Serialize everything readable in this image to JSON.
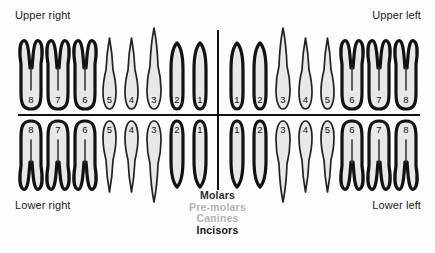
{
  "labels": {
    "upper_right": "Upper right",
    "upper_left": "Upper left",
    "lower_right": "Lower right",
    "lower_left": "Lower left"
  },
  "legend": [
    {
      "label": "Molars",
      "color": "#2b2b2b"
    },
    {
      "label": "Pre-molars",
      "color": "#b4b4b4"
    },
    {
      "label": "Canines",
      "color": "#b4b4b4"
    },
    {
      "label": "Incisors",
      "color": "#111111"
    }
  ],
  "colors": {
    "tooth_fill": "#e8e8e8",
    "outline_thick": "#121212",
    "outline_thin": "#222222",
    "divider": "#111111",
    "background": "#fdfdfd",
    "number": "#111111"
  },
  "chart_data": {
    "type": "diagram",
    "quadrants": [
      {
        "name": "upper_right",
        "label": "Upper right",
        "arch": "upper",
        "order": "lateral-to-medial",
        "teeth": [
          {
            "number": "8",
            "type": "molar",
            "outline": "thick",
            "roots": 2
          },
          {
            "number": "7",
            "type": "molar",
            "outline": "thick",
            "roots": 2
          },
          {
            "number": "6",
            "type": "molar",
            "outline": "thick",
            "roots": 2
          },
          {
            "number": "5",
            "type": "pre-molar",
            "outline": "thin",
            "roots": 1
          },
          {
            "number": "4",
            "type": "pre-molar",
            "outline": "thin",
            "roots": 1
          },
          {
            "number": "3",
            "type": "canine",
            "outline": "thin",
            "roots": 1
          },
          {
            "number": "2",
            "type": "incisor",
            "outline": "thick",
            "roots": 1
          },
          {
            "number": "1",
            "type": "incisor",
            "outline": "thick",
            "roots": 1
          }
        ]
      },
      {
        "name": "upper_left",
        "label": "Upper left",
        "arch": "upper",
        "order": "medial-to-lateral",
        "teeth": [
          {
            "number": "1",
            "type": "incisor",
            "outline": "thick",
            "roots": 1
          },
          {
            "number": "2",
            "type": "incisor",
            "outline": "thick",
            "roots": 1
          },
          {
            "number": "3",
            "type": "canine",
            "outline": "thin",
            "roots": 1
          },
          {
            "number": "4",
            "type": "pre-molar",
            "outline": "thin",
            "roots": 1
          },
          {
            "number": "5",
            "type": "pre-molar",
            "outline": "thin",
            "roots": 1
          },
          {
            "number": "6",
            "type": "molar",
            "outline": "thick",
            "roots": 2
          },
          {
            "number": "7",
            "type": "molar",
            "outline": "thick",
            "roots": 2
          },
          {
            "number": "8",
            "type": "molar",
            "outline": "thick",
            "roots": 2
          }
        ]
      },
      {
        "name": "lower_right",
        "label": "Lower right",
        "arch": "lower",
        "order": "lateral-to-medial",
        "teeth": [
          {
            "number": "8",
            "type": "molar",
            "outline": "thick",
            "roots": 2
          },
          {
            "number": "7",
            "type": "molar",
            "outline": "thick",
            "roots": 2
          },
          {
            "number": "6",
            "type": "molar",
            "outline": "thick",
            "roots": 2
          },
          {
            "number": "5",
            "type": "pre-molar",
            "outline": "thin",
            "roots": 1
          },
          {
            "number": "4",
            "type": "pre-molar",
            "outline": "thin",
            "roots": 1
          },
          {
            "number": "3",
            "type": "canine",
            "outline": "thin",
            "roots": 1
          },
          {
            "number": "2",
            "type": "incisor",
            "outline": "thick",
            "roots": 1
          },
          {
            "number": "1",
            "type": "incisor",
            "outline": "thick",
            "roots": 1
          }
        ]
      },
      {
        "name": "lower_left",
        "label": "Lower left",
        "arch": "lower",
        "order": "medial-to-lateral",
        "teeth": [
          {
            "number": "1",
            "type": "incisor",
            "outline": "thick",
            "roots": 1
          },
          {
            "number": "2",
            "type": "incisor",
            "outline": "thick",
            "roots": 1
          },
          {
            "number": "3",
            "type": "canine",
            "outline": "thin",
            "roots": 1
          },
          {
            "number": "4",
            "type": "pre-molar",
            "outline": "thin",
            "roots": 1
          },
          {
            "number": "5",
            "type": "pre-molar",
            "outline": "thin",
            "roots": 1
          },
          {
            "number": "6",
            "type": "molar",
            "outline": "thick",
            "roots": 2
          },
          {
            "number": "7",
            "type": "molar",
            "outline": "thick",
            "roots": 2
          },
          {
            "number": "8",
            "type": "molar",
            "outline": "thick",
            "roots": 2
          }
        ]
      }
    ]
  }
}
